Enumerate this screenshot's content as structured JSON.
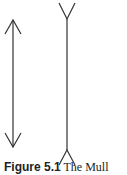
{
  "figure": {
    "label": "Figure 5.1",
    "caption_text": " The Mull",
    "stroke_color": "#333333",
    "left_line": {
      "name": "arrowheads-inward-fins",
      "x": 13,
      "y1": 20,
      "y2": 147
    },
    "right_line": {
      "name": "arrowheads-outward-fins",
      "x": 67,
      "y1": 19,
      "y2": 150
    }
  }
}
